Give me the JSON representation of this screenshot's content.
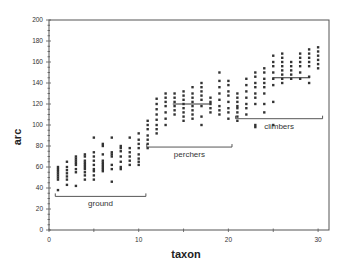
{
  "chart_data": {
    "type": "scatter",
    "title": "",
    "xlabel": "taxon",
    "ylabel": "arc",
    "xlim": [
      0,
      31
    ],
    "ylim": [
      0,
      200
    ],
    "grid": false,
    "legend": null,
    "x_ticks": [
      0,
      10,
      20,
      30
    ],
    "y_ticks": [
      0,
      20,
      40,
      60,
      80,
      100,
      120,
      140,
      160,
      180,
      200
    ],
    "y_minor_step": 5,
    "x_minor_step": 5,
    "marker_color": "#333333",
    "series": [
      {
        "name": "taxon values",
        "points": [
          {
            "x": 1,
            "y": [
              38,
              48,
              50,
              52,
              54,
              56,
              58,
              60
            ]
          },
          {
            "x": 2,
            "y": [
              43,
              48,
              51,
              54,
              57,
              60,
              65
            ]
          },
          {
            "x": 3,
            "y": [
              42,
              55,
              58,
              62,
              64,
              66,
              68,
              70
            ]
          },
          {
            "x": 4,
            "y": [
              48,
              52,
              55,
              58,
              60,
              62,
              64,
              66,
              70,
              72
            ]
          },
          {
            "x": 5,
            "y": [
              48,
              52,
              56,
              58,
              62,
              66,
              70,
              74,
              88
            ]
          },
          {
            "x": 6,
            "y": [
              56,
              58,
              60,
              62,
              64,
              66,
              72,
              80,
              82
            ]
          },
          {
            "x": 7,
            "y": [
              46,
              58,
              62,
              70,
              72,
              74,
              88
            ]
          },
          {
            "x": 8,
            "y": [
              58,
              60,
              65,
              70,
              75,
              78,
              80
            ]
          },
          {
            "x": 9,
            "y": [
              62,
              66,
              70,
              74,
              78,
              88
            ]
          },
          {
            "x": 10,
            "y": [
              62,
              65,
              68,
              72,
              78,
              82,
              86,
              92
            ]
          },
          {
            "x": 11,
            "y": [
              78,
              82,
              86,
              90,
              96,
              100,
              104
            ]
          },
          {
            "x": 12,
            "y": [
              92,
              96,
              100,
              105,
              110,
              115,
              120,
              125
            ]
          },
          {
            "x": 13,
            "y": [
              100,
              106,
              112,
              118,
              122,
              126,
              130
            ]
          },
          {
            "x": 14,
            "y": [
              110,
              114,
              118,
              122,
              126,
              130
            ]
          },
          {
            "x": 15,
            "y": [
              104,
              108,
              112,
              116,
              120,
              124,
              128,
              132
            ]
          },
          {
            "x": 16,
            "y": [
              106,
              110,
              114,
              118,
              122,
              126,
              130,
              136
            ]
          },
          {
            "x": 17,
            "y": [
              100,
              108,
              118,
              124,
              128,
              132,
              136,
              140
            ]
          },
          {
            "x": 18,
            "y": [
              112,
              116,
              120,
              122,
              126
            ]
          },
          {
            "x": 19,
            "y": [
              110,
              114,
              118,
              124,
              130,
              136,
              142,
              150
            ]
          },
          {
            "x": 20,
            "y": [
              106,
              112,
              116,
              122,
              128,
              132,
              138,
              142
            ]
          },
          {
            "x": 21,
            "y": [
              104,
              108,
              112,
              116,
              118,
              122,
              126,
              130
            ]
          },
          {
            "x": 22,
            "y": [
              110,
              116,
              120,
              126,
              132,
              138,
              144
            ]
          },
          {
            "x": 23,
            "y": [
              98,
              100,
              120,
              126,
              130,
              136,
              140,
              146,
              150
            ]
          },
          {
            "x": 24,
            "y": [
              112,
              120,
              130,
              136,
              140,
              144,
              150,
              154
            ]
          },
          {
            "x": 25,
            "y": [
              100,
              122,
              138,
              144,
              150,
              156,
              160,
              166
            ]
          },
          {
            "x": 26,
            "y": [
              140,
              144,
              148,
              152,
              156,
              160,
              164,
              168
            ]
          },
          {
            "x": 27,
            "y": [
              144,
              148,
              152,
              156,
              160
            ]
          },
          {
            "x": 28,
            "y": [
              144,
              150,
              156,
              160,
              164,
              168
            ]
          },
          {
            "x": 29,
            "y": [
              140,
              146,
              156,
              160,
              164,
              168,
              172
            ]
          },
          {
            "x": 30,
            "y": [
              154,
              158,
              162,
              166,
              170,
              174
            ]
          }
        ]
      }
    ],
    "annotations": [
      {
        "type": "bracket",
        "label": "ground",
        "x_range": [
          0.7,
          10.8
        ],
        "y": 32
      },
      {
        "type": "bracket",
        "label": "perchers",
        "x_range": [
          10.9,
          20.4
        ],
        "y": 79
      },
      {
        "type": "bracket",
        "label": "climbers",
        "x_range": [
          20.8,
          30.5
        ],
        "y": 106
      }
    ],
    "mean_lines": [
      {
        "label": "perchers mean",
        "x_range": [
          13.8,
          17.9
        ],
        "y": 120
      },
      {
        "label": "climbers mean",
        "x_range": [
          24.9,
          29.1
        ],
        "y": 145
      }
    ]
  },
  "axes": {
    "xlabel": "taxon",
    "ylabel": "arc",
    "x_tick_labels": [
      "0",
      "10",
      "20",
      "30"
    ],
    "y_tick_labels": [
      "0",
      "20",
      "40",
      "60",
      "80",
      "100",
      "120",
      "140",
      "160",
      "180",
      "200"
    ]
  },
  "groups": {
    "ground": "ground",
    "perchers": "perchers",
    "climbers": "climbers"
  }
}
